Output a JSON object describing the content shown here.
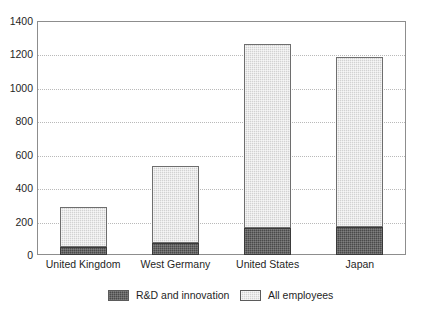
{
  "chart_data": {
    "type": "bar",
    "subtype": "stacked-vertical",
    "title": "",
    "xlabel": "",
    "ylabel": "",
    "ylim": [
      0,
      1400
    ],
    "ytick_step": 200,
    "ytick_labels": [
      "0",
      "200",
      "400",
      "600",
      "800",
      "1000",
      "1200",
      "1400"
    ],
    "ytick_values": [
      0,
      200,
      400,
      600,
      800,
      1000,
      1200,
      1400
    ],
    "grid": true,
    "grid_axis": "y",
    "grid_style": "dotted",
    "legend_position": "bottom",
    "categories": [
      "United Kingdom",
      "West Germany",
      "United States",
      "Japan"
    ],
    "series": [
      {
        "name": "R&D and innovation",
        "color": "#4a4a4a",
        "values": [
          50,
          70,
          160,
          165
        ]
      },
      {
        "name": "All employees",
        "color": "#d2d2d2",
        "values": [
          240,
          460,
          1105,
          1020
        ]
      }
    ],
    "totals": [
      290,
      530,
      1265,
      1185
    ]
  },
  "axes": {
    "y_ticks": [
      {
        "label": "1400",
        "value": 1400
      },
      {
        "label": "1200",
        "value": 1200
      },
      {
        "label": "1000",
        "value": 1000
      },
      {
        "label": "800",
        "value": 800
      },
      {
        "label": "600",
        "value": 600
      },
      {
        "label": "400",
        "value": 400
      },
      {
        "label": "200",
        "value": 200
      },
      {
        "label": "0",
        "value": 0
      }
    ],
    "x_ticks": [
      {
        "label": "United Kingdom"
      },
      {
        "label": "West Germany"
      },
      {
        "label": "United States"
      },
      {
        "label": "Japan"
      }
    ]
  },
  "legend": {
    "items": [
      {
        "label": "R&D and innovation",
        "color": "#4a4a4a"
      },
      {
        "label": "All employees",
        "color": "#d2d2d2"
      }
    ]
  }
}
